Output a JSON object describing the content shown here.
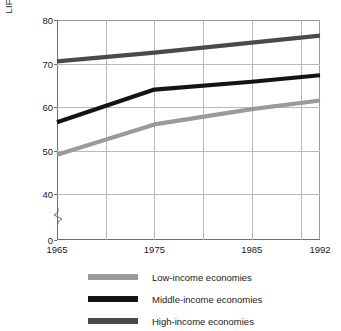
{
  "chart_data": {
    "type": "line",
    "title": "",
    "xlabel": "",
    "ylabel": "LIFE EXPECTANCY IN YEARS",
    "xlim": [
      1965,
      1992
    ],
    "ylim": [
      38,
      80
    ],
    "grid": true,
    "legend_position": "bottom",
    "x": [
      1965,
      1975,
      1985,
      1992
    ],
    "xticks": [
      "1965",
      "1975",
      "1985",
      "1992"
    ],
    "yticks": [
      "0",
      "40",
      "50",
      "60",
      "70",
      "80"
    ],
    "y_axis_break": true,
    "y_axis_break_symbol": "zigzag",
    "x_gridline_years": [
      1965,
      1970,
      1975,
      1980,
      1985,
      1990,
      1992
    ],
    "series": [
      {
        "name": "Low-income economies",
        "color": "#9a9a9a",
        "values": [
          49.0,
          56.0,
          59.5,
          61.5
        ]
      },
      {
        "name": "Middle-income economies",
        "color": "#141414",
        "values": [
          56.5,
          64.0,
          65.8,
          67.3
        ]
      },
      {
        "name": "High-income economies",
        "color": "#4a4a4a",
        "values": [
          70.5,
          72.5,
          74.8,
          76.4
        ]
      }
    ]
  },
  "legend": {
    "items": [
      {
        "label": "Low-income economies",
        "color": "#9a9a9a"
      },
      {
        "label": "Middle-income economies",
        "color": "#141414"
      },
      {
        "label": "High-income economies",
        "color": "#4a4a4a"
      }
    ]
  },
  "colors": {
    "background": "#ffffff",
    "axis": "#6e6e6e",
    "gridline": "#b8b8b8",
    "text": "#1a1a1a"
  }
}
